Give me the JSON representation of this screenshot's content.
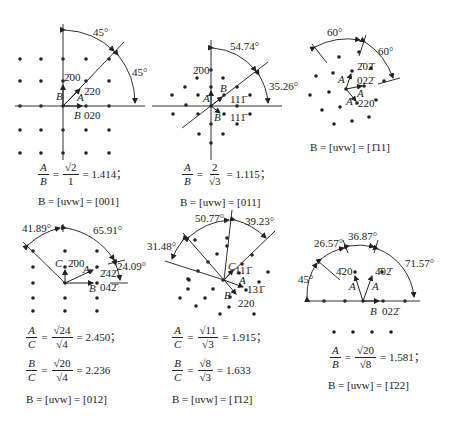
{
  "panels": [
    {
      "id": "001",
      "angles": [
        "45°",
        "45°"
      ],
      "spots": [
        "2̄00",
        "2̄20",
        "020"
      ],
      "vectors": [
        "A",
        "B",
        "B"
      ],
      "formulas": [
        {
          "lhs_num": "A",
          "lhs_den": "B",
          "rhs_num": "√2",
          "rhs_den": "1",
          "value": "= 1.414；"
        }
      ],
      "zone_axis": "B = [uvw] = [001]"
    },
    {
      "id": "011",
      "angles": [
        "54.74°",
        "35.26°"
      ],
      "spots": [
        "2̄00",
        "111̄",
        "111̄"
      ],
      "vectors": [
        "A",
        "B",
        "B"
      ],
      "formulas": [
        {
          "lhs_num": "A",
          "lhs_den": "B",
          "rhs_num": "2",
          "rhs_den": "√3",
          "value": "= 1.115；"
        }
      ],
      "zone_axis": "B = [uvw] = [011]"
    },
    {
      "id": "-111",
      "angles": [
        "60°",
        "60°"
      ],
      "spots": [
        "2̄02̄",
        "022̄",
        "220"
      ],
      "vectors": [
        "A",
        "A",
        "A"
      ],
      "formulas": [],
      "zone_axis": "B = [uvw] = [1̄11]"
    },
    {
      "id": "012",
      "angles": [
        "41.89°",
        "65.91°",
        "24.09°"
      ],
      "spots": [
        "2̄00",
        "2̄42̄",
        "042̄"
      ],
      "vectors": [
        "C",
        "A",
        "B"
      ],
      "formulas": [
        {
          "lhs_num": "A",
          "lhs_den": "C",
          "rhs_num": "√24",
          "rhs_den": "√4",
          "value": "= 2.450；"
        },
        {
          "lhs_num": "B",
          "lhs_den": "C",
          "rhs_num": "√20",
          "rhs_den": "√4",
          "value": "= 2.236"
        }
      ],
      "zone_axis": "B = [uvw] = [012]"
    },
    {
      "id": "-112",
      "angles": [
        "50.77°",
        "39.23°",
        "31.48°"
      ],
      "spots": [
        "111̄",
        "131̄",
        "220"
      ],
      "vectors": [
        "C",
        "A",
        "B"
      ],
      "formulas": [
        {
          "lhs_num": "A",
          "lhs_den": "C",
          "rhs_num": "√11",
          "rhs_den": "√3",
          "value": "= 1.915；"
        },
        {
          "lhs_num": "B",
          "lhs_den": "C",
          "rhs_num": "√8",
          "rhs_den": "√3",
          "value": "= 1.633"
        }
      ],
      "zone_axis": "B = [uvw] = [1̄12]"
    },
    {
      "id": "-122",
      "angles": [
        "26.57°",
        "36.87°",
        "71.57°",
        "45°"
      ],
      "spots": [
        "4̄20",
        "4̄02̄",
        "022̄"
      ],
      "vectors": [
        "A",
        "A",
        "B"
      ],
      "formulas": [
        {
          "lhs_num": "A",
          "lhs_den": "B",
          "rhs_num": "√20",
          "rhs_den": "√8",
          "value": "= 1.581；"
        }
      ],
      "zone_axis": "B = [uvw] = [1̄22]"
    }
  ]
}
